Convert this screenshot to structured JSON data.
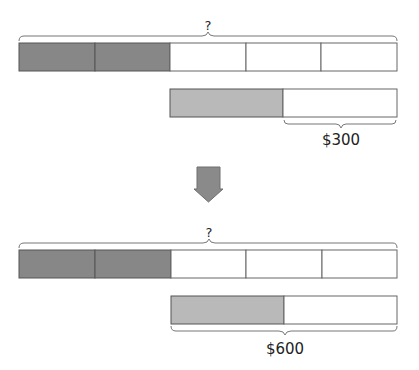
{
  "colors": {
    "dark_fill": "#878787",
    "light_fill": "#b9b9b9",
    "empty_fill": "#ffffff",
    "stroke": "#555555",
    "arrow_fill": "#8a8a8a",
    "brace": "#777777"
  },
  "panels": [
    {
      "question_label": "?",
      "top_bar": {
        "segments": 5,
        "shaded": 2
      },
      "bottom_bar": {
        "segments": 2,
        "shaded": 1
      },
      "brace_label": "$300",
      "brace_span": "unshaded half of bottom bar"
    },
    {
      "question_label": "?",
      "top_bar": {
        "segments": 5,
        "shaded": 2
      },
      "bottom_bar": {
        "segments": 2,
        "shaded": 1
      },
      "brace_label": "$600",
      "brace_span": "entire bottom bar"
    }
  ],
  "arrow": {
    "direction": "down"
  }
}
